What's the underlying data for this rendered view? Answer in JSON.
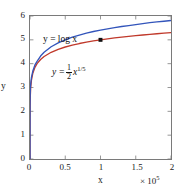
{
  "chart_data": {
    "type": "line",
    "title": "",
    "xlabel": "x",
    "ylabel": "y",
    "xlim": [
      0,
      2
    ],
    "ylim": [
      0,
      6
    ],
    "x_multiplier": "× 10",
    "x_multiplier_exponent": "5",
    "x_multiplier_full": "× 10⁵",
    "xticks": [
      "0",
      "0.5",
      "1",
      "1.5",
      "2"
    ],
    "xtick_values": [
      0,
      0.5,
      1,
      1.5,
      2
    ],
    "yticks": [
      "0",
      "1",
      "2",
      "3",
      "4",
      "5",
      "6"
    ],
    "ytick_values": [
      0,
      1,
      2,
      3,
      4,
      5,
      6
    ],
    "grid": false,
    "legend_position": "inside-annotations",
    "frame": "box-all-sides-inward-ticks",
    "series": [
      {
        "name": "y = log x",
        "color": "#c0392b",
        "label_text_lhs": "y = log x",
        "x": [
          0.0,
          0.0005,
          0.002,
          0.005,
          0.01,
          0.02,
          0.04,
          0.07,
          0.1,
          0.15,
          0.2,
          0.3,
          0.4,
          0.5,
          0.6,
          0.7,
          0.8,
          0.9,
          1.0,
          1.1,
          1.2,
          1.3,
          1.4,
          1.5,
          1.6,
          1.7,
          1.8,
          1.9,
          2.0
        ],
        "values": [
          0.0,
          1.699,
          2.301,
          2.699,
          3.0,
          3.301,
          3.602,
          3.845,
          4.0,
          4.176,
          4.301,
          4.477,
          4.602,
          4.699,
          4.778,
          4.845,
          4.903,
          4.954,
          5.0,
          5.041,
          5.079,
          5.114,
          5.146,
          5.176,
          5.204,
          5.23,
          5.255,
          5.279,
          5.301
        ]
      },
      {
        "name": "y = (1/2) x^(1/5)",
        "color": "#3355bb",
        "label_lhs": "y =",
        "label_numerator": "1",
        "label_denominator": "2",
        "label_base": "x",
        "label_exponent": "1/5",
        "x": [
          0.0,
          0.0005,
          0.002,
          0.005,
          0.01,
          0.02,
          0.04,
          0.07,
          0.1,
          0.15,
          0.2,
          0.3,
          0.4,
          0.5,
          0.6,
          0.7,
          0.8,
          0.9,
          1.0,
          1.1,
          1.2,
          1.3,
          1.4,
          1.5,
          1.6,
          1.7,
          1.8,
          1.9,
          2.0
        ],
        "values": [
          0.0,
          2.19,
          2.63,
          2.97,
          3.15,
          3.41,
          3.69,
          3.95,
          4.1,
          4.32,
          4.48,
          4.71,
          4.87,
          5.0,
          5.11,
          5.2,
          5.28,
          5.35,
          5.41,
          5.46,
          5.51,
          5.56,
          5.6,
          5.64,
          5.68,
          5.72,
          5.75,
          5.78,
          5.81
        ]
      }
    ],
    "annotations": [
      {
        "name": "intersection-point",
        "x": 1.0,
        "y": 5.0,
        "marker": "square",
        "color": "#111111",
        "label": ""
      }
    ]
  }
}
